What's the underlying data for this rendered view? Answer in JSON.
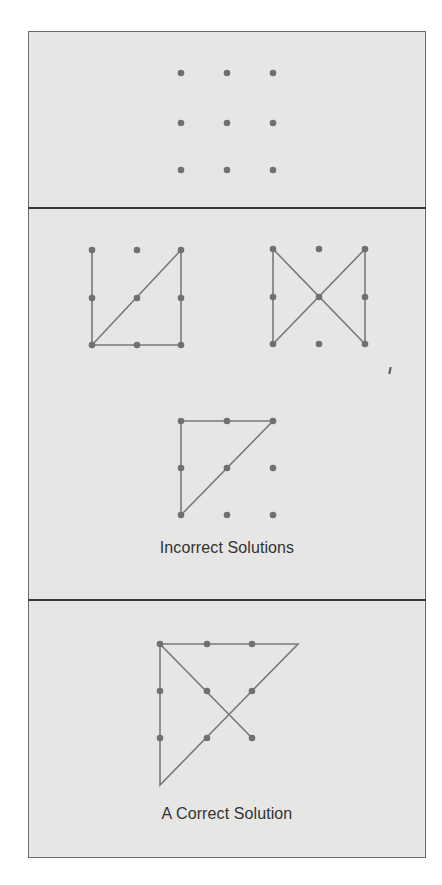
{
  "panels": [
    {
      "id": "problem",
      "caption": null
    },
    {
      "id": "incorrect",
      "caption": "Incorrect Solutions"
    },
    {
      "id": "correct",
      "caption": "A Correct Solution"
    }
  ],
  "colors": {
    "panel_background": "#e6e6e4",
    "border": "#6a6a6a",
    "divider": "#3a3a3a",
    "dot": "#707070",
    "line": "#7a7a7a",
    "caption": "#333333"
  },
  "figures": {
    "problem_grid": {
      "dots": [
        [
          181,
          73
        ],
        [
          227,
          73
        ],
        [
          273,
          73
        ],
        [
          181,
          123
        ],
        [
          227,
          123
        ],
        [
          273,
          123
        ],
        [
          181,
          170
        ],
        [
          227,
          170
        ],
        [
          273,
          170
        ]
      ],
      "path": []
    },
    "incorrect_1": {
      "dots": [
        [
          92,
          250
        ],
        [
          137,
          250
        ],
        [
          181,
          250
        ],
        [
          92,
          298
        ],
        [
          137,
          298
        ],
        [
          181,
          298
        ],
        [
          92,
          345
        ],
        [
          137,
          345
        ],
        [
          181,
          345
        ]
      ],
      "path": [
        [
          92,
          250
        ],
        [
          92,
          345
        ],
        [
          181,
          345
        ],
        [
          181,
          250
        ],
        [
          92,
          345
        ]
      ]
    },
    "incorrect_2": {
      "dots": [
        [
          273,
          249
        ],
        [
          319,
          249
        ],
        [
          365,
          249
        ],
        [
          273,
          297
        ],
        [
          319,
          297
        ],
        [
          365,
          297
        ],
        [
          273,
          344
        ],
        [
          319,
          344
        ],
        [
          365,
          344
        ]
      ],
      "path": [
        [
          273,
          249
        ],
        [
          273,
          344
        ],
        [
          365,
          249
        ],
        [
          365,
          344
        ],
        [
          273,
          249
        ]
      ]
    },
    "incorrect_3": {
      "dots": [
        [
          181,
          421
        ],
        [
          227,
          421
        ],
        [
          273,
          421
        ],
        [
          181,
          468
        ],
        [
          227,
          468
        ],
        [
          273,
          468
        ],
        [
          181,
          515
        ],
        [
          227,
          515
        ],
        [
          273,
          515
        ]
      ],
      "path": [
        [
          181,
          515
        ],
        [
          181,
          421
        ],
        [
          273,
          421
        ],
        [
          181,
          515
        ]
      ]
    },
    "correct": {
      "dots": [
        [
          160,
          644
        ],
        [
          207,
          644
        ],
        [
          252,
          644
        ],
        [
          160,
          691
        ],
        [
          207,
          691
        ],
        [
          252,
          691
        ],
        [
          160,
          738
        ],
        [
          207,
          738
        ],
        [
          252,
          738
        ]
      ],
      "path": [
        [
          252,
          738
        ],
        [
          160,
          644
        ],
        [
          298,
          644
        ],
        [
          160,
          785
        ],
        [
          160,
          644
        ]
      ]
    }
  }
}
